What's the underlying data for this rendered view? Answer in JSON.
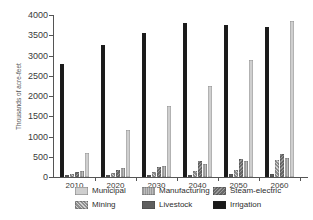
{
  "figure": {
    "y_axis_label": "Thousands of acre-feet"
  },
  "chart_data": {
    "type": "bar",
    "title": "",
    "xlabel": "",
    "ylabel": "Thousands of acre-feet",
    "ylim": [
      0,
      4000
    ],
    "ytick_step": 500,
    "yticks": [
      0,
      500,
      1000,
      1500,
      2000,
      2500,
      3000,
      3500,
      4000
    ],
    "grid": false,
    "categories": [
      "2010",
      "2020",
      "2030",
      "2040",
      "2050",
      "2060"
    ],
    "bar_order": [
      "Irrigation",
      "Livestock",
      "Mining",
      "Steam-electric",
      "Manufacturing",
      "Municipal"
    ],
    "series": [
      {
        "name": "Municipal",
        "values": [
          600,
          1150,
          1750,
          2250,
          2900,
          3850
        ],
        "color": "#cfcfcf",
        "pattern": "solid"
      },
      {
        "name": "Manufacturing",
        "values": [
          160,
          210,
          260,
          310,
          400,
          460
        ],
        "color": "#9b9b9b",
        "pattern": "dots"
      },
      {
        "name": "Steam-electric",
        "values": [
          120,
          170,
          250,
          400,
          450,
          580
        ],
        "color": "#6a6a6a",
        "pattern": "hatch"
      },
      {
        "name": "Mining",
        "values": [
          70,
          100,
          130,
          160,
          180,
          430
        ],
        "color": "#8f8f8f",
        "pattern": "stripes"
      },
      {
        "name": "Livestock",
        "values": [
          40,
          45,
          50,
          55,
          65,
          80
        ],
        "color": "#5f5f5f",
        "pattern": "solid"
      },
      {
        "name": "Irrigation",
        "values": [
          2800,
          3250,
          3550,
          3800,
          3750,
          3700
        ],
        "color": "#1a1a1a",
        "pattern": "solid"
      }
    ],
    "legend": {
      "position": "bottom",
      "rows": [
        [
          "Municipal",
          "Manufacturing",
          "Steam-electric"
        ],
        [
          "Mining",
          "Livestock",
          "Irrigation"
        ]
      ]
    }
  }
}
